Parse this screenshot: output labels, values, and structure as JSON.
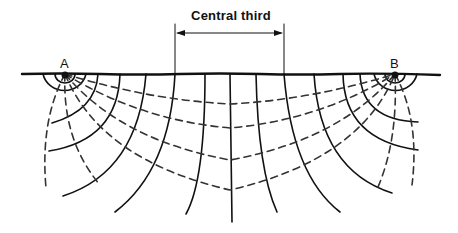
{
  "diagram": {
    "title_label": "Central third",
    "electrodes": [
      {
        "label": "A",
        "x": 65,
        "y": 74
      },
      {
        "label": "B",
        "x": 395,
        "y": 74
      }
    ],
    "central_third": {
      "x_start": 176,
      "x_end": 284
    },
    "legend_semantics": {
      "solid": "equipotential lines",
      "dashed": "current flow lines"
    },
    "colors": {
      "line": "#111111",
      "background": "#ffffff"
    }
  }
}
